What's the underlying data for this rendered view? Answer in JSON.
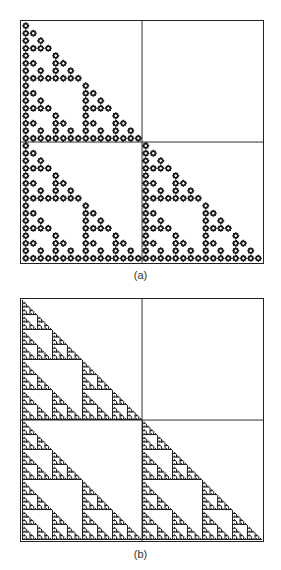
{
  "figure": {
    "panels": [
      {
        "id": "a",
        "caption": "(a)",
        "description": "Recursive quadrant fractal built from star/cross motifs; top-right quadrant empty at every level",
        "empty_quadrant": "top-right",
        "motif": "star-cross",
        "divider_lines": {
          "vertical": true,
          "horizontal": true
        }
      },
      {
        "id": "b",
        "caption": "(b)",
        "description": "Recursive quadrant fractal forming branching tree shapes along left edge and bottom edge; top-right quadrant empty at every level",
        "empty_quadrant": "top-right",
        "motif": "tree-branch",
        "divider_lines": {
          "vertical": true,
          "horizontal": true
        }
      }
    ],
    "colors": {
      "ink": "#1a1a1a",
      "frame": "#222222",
      "background": "#ffffff",
      "caption": "#333333"
    }
  }
}
